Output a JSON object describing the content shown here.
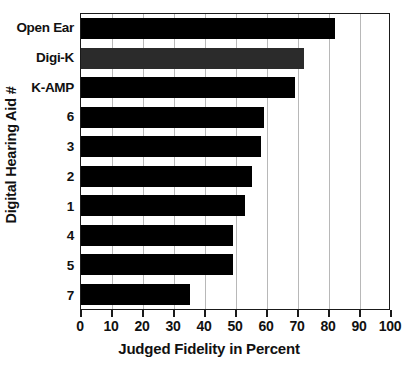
{
  "chart_data": {
    "type": "bar",
    "orientation": "horizontal",
    "title": "",
    "xlabel": "Judged Fidelity in Percent",
    "ylabel": "Digital Hearing Aid #",
    "categories": [
      "Open Ear",
      "Digi-K",
      "K-AMP",
      "6",
      "3",
      "2",
      "1",
      "4",
      "5",
      "7"
    ],
    "values": [
      82,
      72,
      69,
      59,
      58,
      55,
      53,
      49,
      49,
      35
    ],
    "xlim": [
      0,
      100
    ],
    "xticks": [
      0,
      10,
      20,
      30,
      40,
      50,
      60,
      70,
      80,
      90,
      100
    ],
    "xtick_labels": [
      "0",
      "10",
      "20",
      "30",
      "40",
      "50",
      "60",
      "70",
      "80",
      "90",
      "100"
    ],
    "grid": true,
    "grid_axis": "x",
    "legend": false,
    "bar_colors": [
      "#000000",
      "#2b2b2b",
      "#000000",
      "#000000",
      "#000000",
      "#000000",
      "#000000",
      "#000000",
      "#000000",
      "#000000"
    ],
    "colors": {
      "bar": "#000000",
      "bar_alt": "#2b2b2b",
      "axis": "#1a1a1a",
      "grid": "#b8b8b8",
      "text": "#111111",
      "background": "#ffffff"
    }
  }
}
